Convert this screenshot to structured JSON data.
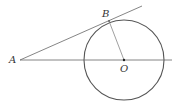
{
  "diagram": {
    "type": "geometry",
    "colors": {
      "stroke": "#555555",
      "label": "#333333",
      "background": "#ffffff"
    },
    "points": {
      "A": {
        "label": "A",
        "x": 20,
        "y": 60
      },
      "B": {
        "label": "B",
        "x": 109,
        "y": 21
      },
      "O": {
        "label": "O",
        "x": 124,
        "y": 60
      }
    },
    "circle": {
      "center": "O",
      "cx": 124,
      "cy": 60,
      "r": 40
    },
    "segments": [
      {
        "name": "line-AO",
        "from": "A",
        "to_x": 172,
        "to_y": 60
      },
      {
        "name": "tangent-AB",
        "from": "A",
        "to_x": 142,
        "to_y": 6
      },
      {
        "name": "radius-OB",
        "from": "O",
        "to": "B"
      }
    ]
  }
}
